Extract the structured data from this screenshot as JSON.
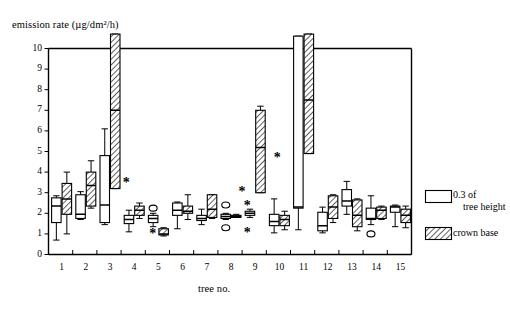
{
  "chart_data": {
    "type": "box",
    "title": "",
    "ylabel": "emission rate (µg/dm²/h)",
    "xlabel": "tree no.",
    "ylim": [
      0,
      10
    ],
    "yticks": [
      0,
      1,
      2,
      3,
      4,
      5,
      6,
      7,
      8,
      9,
      10
    ],
    "ytick_labels": [
      "0",
      "1",
      "2",
      "3",
      "4",
      "5",
      "6",
      "7",
      "8",
      "9",
      "10"
    ],
    "categories": [
      "1",
      "2",
      "3",
      "4",
      "5",
      "6",
      "7",
      "8",
      "9",
      "10",
      "11",
      "12",
      "13",
      "14",
      "15"
    ],
    "xtick_labels": [
      "1",
      "2",
      "3",
      "4",
      "5",
      "6",
      "7",
      "8",
      "9",
      "10",
      "11",
      "12",
      "13",
      "14",
      "15"
    ],
    "grid": false,
    "legend_position": "right",
    "legend": [
      {
        "name": "0.3 of tree height",
        "fill": "open",
        "label_line1": "0.3 of",
        "label_line2": "tree height"
      },
      {
        "name": "crown base",
        "fill": "hatched",
        "label_line1": "crown base",
        "label_line2": ""
      }
    ],
    "series": [
      {
        "name": "0.3 of tree height",
        "fill": "open",
        "boxes": [
          {
            "tree": "1",
            "whisker_low": 0.7,
            "q1": 1.55,
            "median": 2.35,
            "q3": 2.75,
            "whisker_high": 2.85
          },
          {
            "tree": "2",
            "whisker_low": 1.7,
            "q1": 1.75,
            "median": 1.95,
            "q3": 2.9,
            "whisker_high": 3.05
          },
          {
            "tree": "3",
            "whisker_low": 1.45,
            "q1": 1.55,
            "median": 2.4,
            "q3": 4.8,
            "whisker_high": 6.1
          },
          {
            "tree": "4",
            "whisker_low": 1.1,
            "q1": 1.5,
            "median": 1.7,
            "q3": 1.9,
            "whisker_high": 2.15
          },
          {
            "tree": "5",
            "whisker_low": 1.35,
            "q1": 1.55,
            "median": 1.75,
            "q3": 1.9,
            "whisker_high": 2.0,
            "outliers": [
              2.25
            ]
          },
          {
            "tree": "6",
            "whisker_low": 1.25,
            "q1": 1.9,
            "median": 2.15,
            "q3": 2.5,
            "whisker_high": 2.55
          },
          {
            "tree": "7",
            "whisker_low": 1.45,
            "q1": 1.65,
            "median": 1.75,
            "q3": 1.9,
            "whisker_high": 2.2
          },
          {
            "tree": "8",
            "whisker_low": 1.7,
            "q1": 1.75,
            "median": 1.85,
            "q3": 1.95,
            "whisker_high": 2.0,
            "outliers": [
              2.4,
              1.3
            ]
          },
          {
            "tree": "9",
            "whisker_low": 1.8,
            "q1": 1.9,
            "median": 2.0,
            "q3": 2.1,
            "whisker_high": 2.2
          },
          {
            "tree": "10",
            "whisker_low": 1.05,
            "q1": 1.4,
            "median": 1.6,
            "q3": 1.95,
            "whisker_high": 2.7
          },
          {
            "tree": "11",
            "whisker_low": 1.2,
            "q1": 2.25,
            "median": 2.3,
            "q3": 10.6,
            "whisker_high": 10.6
          },
          {
            "tree": "12",
            "whisker_low": 1.05,
            "q1": 1.15,
            "median": 1.4,
            "q3": 2.05,
            "whisker_high": 2.3
          },
          {
            "tree": "13",
            "whisker_low": 1.95,
            "q1": 2.35,
            "median": 2.6,
            "q3": 3.15,
            "whisker_high": 3.55
          },
          {
            "tree": "14",
            "whisker_low": 1.45,
            "q1": 1.7,
            "median": 1.75,
            "q3": 2.25,
            "whisker_high": 2.85,
            "outliers": [
              1.0
            ]
          },
          {
            "tree": "15",
            "whisker_low": 1.35,
            "q1": 2.05,
            "median": 2.3,
            "q3": 2.35,
            "whisker_high": 2.4
          }
        ]
      },
      {
        "name": "crown base",
        "fill": "hatched",
        "boxes": [
          {
            "tree": "1",
            "whisker_low": 1.0,
            "q1": 1.95,
            "median": 2.7,
            "q3": 3.45,
            "whisker_high": 4.0
          },
          {
            "tree": "2",
            "whisker_low": 2.25,
            "q1": 2.35,
            "median": 3.35,
            "q3": 4.0,
            "whisker_high": 4.55
          },
          {
            "tree": "3",
            "whisker_low": 3.2,
            "q1": 3.2,
            "median": 7.0,
            "q3": 10.7,
            "whisker_high": 10.7
          },
          {
            "tree": "4",
            "whisker_low": 1.75,
            "q1": 1.9,
            "median": 2.15,
            "q3": 2.35,
            "whisker_high": 2.5
          },
          {
            "tree": "5",
            "whisker_low": 0.9,
            "q1": 0.95,
            "median": 1.0,
            "q3": 1.25,
            "whisker_high": 1.3
          },
          {
            "tree": "6",
            "whisker_low": 1.7,
            "q1": 2.0,
            "median": 2.1,
            "q3": 2.35,
            "whisker_high": 2.9
          },
          {
            "tree": "7",
            "whisker_low": 1.75,
            "q1": 1.8,
            "median": 2.2,
            "q3": 2.9,
            "whisker_high": 2.9
          },
          {
            "tree": "8",
            "whisker_low": 1.8,
            "q1": 1.8,
            "median": 1.85,
            "q3": 1.9,
            "whisker_high": 1.95
          },
          {
            "tree": "9",
            "whisker_low": 3.0,
            "q1": 3.0,
            "median": 5.2,
            "q3": 7.0,
            "whisker_high": 7.2
          },
          {
            "tree": "10",
            "whisker_low": 1.2,
            "q1": 1.4,
            "median": 1.7,
            "q3": 1.9,
            "whisker_high": 2.1
          },
          {
            "tree": "11",
            "whisker_low": 4.9,
            "q1": 4.9,
            "median": 7.5,
            "q3": 10.7,
            "whisker_high": 10.7
          },
          {
            "tree": "12",
            "whisker_low": 1.55,
            "q1": 1.75,
            "median": 2.3,
            "q3": 2.85,
            "whisker_high": 2.9
          },
          {
            "tree": "13",
            "whisker_low": 1.15,
            "q1": 1.35,
            "median": 1.9,
            "q3": 2.65,
            "whisker_high": 2.7
          },
          {
            "tree": "14",
            "whisker_low": 1.7,
            "q1": 1.75,
            "median": 2.15,
            "q3": 2.3,
            "whisker_high": 2.35
          },
          {
            "tree": "15",
            "whisker_low": 1.3,
            "q1": 1.55,
            "median": 1.9,
            "q3": 2.2,
            "whisker_high": 2.35
          }
        ]
      }
    ],
    "significance_markers": [
      {
        "tree": "3",
        "value": 3.5,
        "symbol": "*"
      },
      {
        "tree": "5",
        "value": 1.0,
        "symbol": "*"
      },
      {
        "tree": "8",
        "value": 2.4,
        "symbol": "*"
      },
      {
        "tree": "8",
        "value": 1.05,
        "symbol": "*"
      },
      {
        "tree": "9",
        "value": 3.05,
        "symbol": "*"
      },
      {
        "tree": "10",
        "value": 4.7,
        "symbol": "*"
      }
    ]
  }
}
